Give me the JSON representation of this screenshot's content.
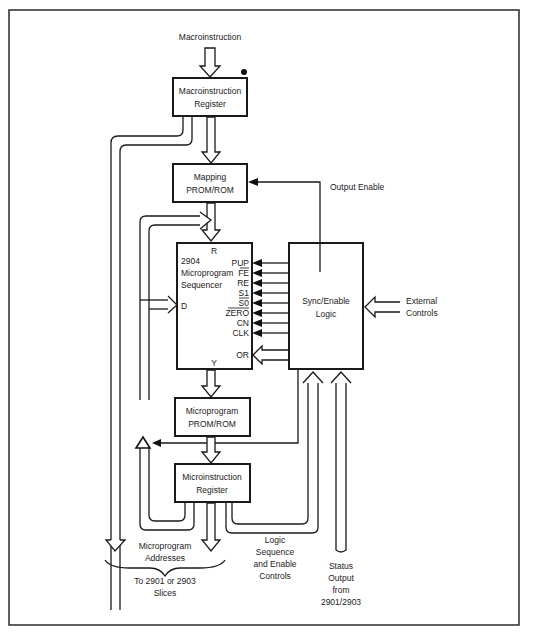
{
  "diagram": {
    "title_input": "Macroinstruction",
    "blocks": {
      "macro_register": {
        "line1": "Macroinstruction",
        "line2": "Register"
      },
      "mapping_prom": {
        "line1": "Mapping",
        "line2": "PROM/ROM"
      },
      "sequencer": {
        "line1": "2904",
        "line2": "Microprogram",
        "line3": "Sequencer",
        "port_r": "R",
        "port_d": "D",
        "port_y": "Y"
      },
      "sync_logic": {
        "line1": "Sync/Enable",
        "line2": "Logic"
      },
      "micro_prom": {
        "line1": "Microprogram",
        "line2": "PROM/ROM"
      },
      "micro_register": {
        "line1": "Microinstruction",
        "line2": "Register"
      }
    },
    "sequencer_pins": [
      "PUP",
      "FE",
      "RE",
      "S1",
      "S0",
      "ZERO",
      "CN",
      "CLK"
    ],
    "sequencer_pins_overbar": [
      false,
      true,
      false,
      false,
      true,
      true,
      false,
      false
    ],
    "or_pin": "OR",
    "labels": {
      "output_enable": "Output Enable",
      "external_controls_1": "External",
      "external_controls_2": "Controls",
      "micro_addresses_1": "Microprogram",
      "micro_addresses_2": "Addresses",
      "to_slices_1": "To 2901 or 2903",
      "to_slices_2": "Slices",
      "logic_seq_1": "Logic",
      "logic_seq_2": "Sequence",
      "logic_seq_3": "and Enable",
      "logic_seq_4": "Controls",
      "status_1": "Status",
      "status_2": "Output",
      "status_3": "from",
      "status_4": "2901/2903"
    }
  }
}
